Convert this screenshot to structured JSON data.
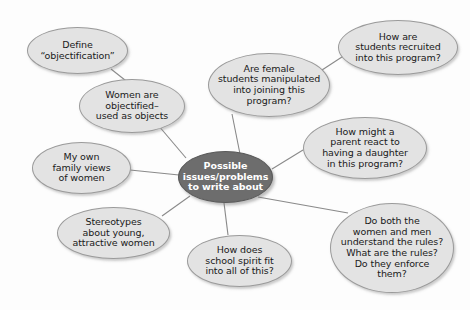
{
  "diagram": {
    "title": "Possible issues/problems to write about",
    "type": "concept-map",
    "background_color": "#fdfdfd",
    "node_fill": "#e3e3e3",
    "node_stroke": "#9a9a9a",
    "center_fill": "#6d6d6d",
    "center_text_color": "#ffffff",
    "edge_color": "#8a8a8a"
  },
  "center": {
    "id": "center",
    "label": "Possible\nissues/problems\nto write about",
    "x": 178,
    "y": 151,
    "w": 95,
    "h": 52,
    "font_size": 9.5
  },
  "nodes": [
    {
      "id": "define-objectification",
      "label": "Define\n“objectification”",
      "x": 27,
      "y": 27,
      "w": 101,
      "h": 47,
      "font_size": 9.5
    },
    {
      "id": "women-objectified",
      "label": "Women are\nobjectified–\nused as objects",
      "x": 79,
      "y": 79,
      "w": 106,
      "h": 54,
      "font_size": 9.5
    },
    {
      "id": "family-views",
      "label": "My own\nfamily views\nof women",
      "x": 32,
      "y": 142,
      "w": 99,
      "h": 52,
      "font_size": 9.5
    },
    {
      "id": "stereotypes",
      "label": "Stereotypes\nabout young,\nattractive women",
      "x": 57,
      "y": 207,
      "w": 113,
      "h": 52,
      "font_size": 9.5
    },
    {
      "id": "school-spirit",
      "label": "How does\nschool spirit fit\ninto all of this?",
      "x": 187,
      "y": 235,
      "w": 105,
      "h": 52,
      "font_size": 9.5
    },
    {
      "id": "female-students-manipulated",
      "label": "Are female\nstudents manipulated\ninto joining this\nprogram?",
      "x": 208,
      "y": 53,
      "w": 122,
      "h": 64,
      "font_size": 9.5
    },
    {
      "id": "students-recruited",
      "label": "How are\nstudents recruited\ninto this program?",
      "x": 338,
      "y": 20,
      "w": 120,
      "h": 55,
      "font_size": 9.5
    },
    {
      "id": "parent-react",
      "label": "How might a\nparent react to\nhaving a daughter\nin this program?",
      "x": 303,
      "y": 117,
      "w": 124,
      "h": 62,
      "font_size": 9.5
    },
    {
      "id": "understand-rules",
      "label": "Do both the\nwomen and men\nunderstand the rules?\nWhat are the rules?\nDo they enforce\nthem?",
      "x": 330,
      "y": 203,
      "w": 124,
      "h": 90,
      "font_size": 9.5
    }
  ],
  "edges": [
    {
      "from": "define-objectification",
      "to": "women-objectified",
      "x1": 111,
      "y1": 69,
      "x2": 130,
      "y2": 84
    },
    {
      "from": "women-objectified",
      "to": "center",
      "x1": 158,
      "y1": 125,
      "x2": 186,
      "y2": 158
    },
    {
      "from": "family-views",
      "to": "center",
      "x1": 130,
      "y1": 170,
      "x2": 179,
      "y2": 175
    },
    {
      "from": "stereotypes",
      "to": "center",
      "x1": 162,
      "y1": 216,
      "x2": 190,
      "y2": 196
    },
    {
      "from": "school-spirit",
      "to": "center",
      "x1": 228,
      "y1": 235,
      "x2": 224,
      "y2": 203
    },
    {
      "from": "female-students-manipulated",
      "to": "center",
      "x1": 232,
      "y1": 114,
      "x2": 240,
      "y2": 154
    },
    {
      "from": "female-students-manipulated",
      "to": "students-recruited",
      "x1": 322,
      "y1": 70,
      "x2": 345,
      "y2": 55
    },
    {
      "from": "parent-react",
      "to": "center",
      "x1": 303,
      "y1": 150,
      "x2": 272,
      "y2": 169
    },
    {
      "from": "understand-rules",
      "to": "center",
      "x1": 348,
      "y1": 213,
      "x2": 258,
      "y2": 197
    }
  ]
}
